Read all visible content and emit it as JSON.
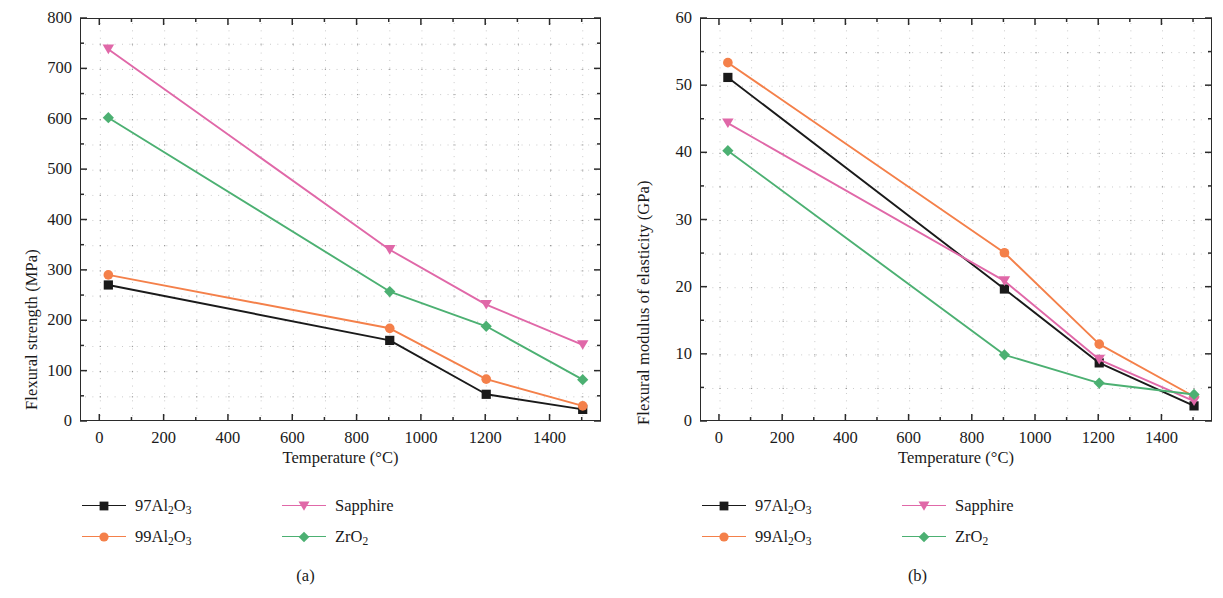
{
  "figure": {
    "panels": [
      {
        "caption": "(a)",
        "chart_data": {
          "type": "line",
          "title": "",
          "xlabel": "Temperature (°C)",
          "ylabel": "Flexural strength (MPa)",
          "xlim": [
            -60,
            1560
          ],
          "ylim": [
            0,
            800
          ],
          "xticks": [
            0,
            200,
            400,
            600,
            800,
            1000,
            1200,
            1400
          ],
          "yticks": [
            0,
            100,
            200,
            300,
            400,
            500,
            600,
            700,
            800
          ],
          "xtick_labels": [
            "0",
            "200",
            "400",
            "600",
            "800",
            "1000",
            "1200",
            "1400"
          ],
          "ytick_labels": [
            "0",
            "100",
            "200",
            "300",
            "400",
            "500",
            "600",
            "700",
            "800"
          ],
          "grid": "dotted-minor",
          "legend_position": "below",
          "x": [
            25,
            900,
            1200,
            1500
          ],
          "series": [
            {
              "name": "97Al2O3",
              "label": "97Al₂O₃",
              "color": "#1a1a1a",
              "marker": "square",
              "values": [
                272,
                162,
                55,
                25
              ]
            },
            {
              "name": "99Al2O3",
              "label": "99Al₂O₃",
              "color": "#f4804a",
              "marker": "circle",
              "values": [
                292,
                186,
                85,
                32
              ]
            },
            {
              "name": "Sapphire",
              "label": "Sapphire",
              "color": "#e068a8",
              "marker": "triangle-down",
              "values": [
                740,
                342,
                233,
                153
              ]
            },
            {
              "name": "ZrO2",
              "label": "ZrO₂",
              "color": "#4cb072",
              "marker": "diamond",
              "values": [
                604,
                259,
                190,
                84
              ]
            }
          ]
        }
      },
      {
        "caption": "(b)",
        "chart_data": {
          "type": "line",
          "title": "",
          "xlabel": "Temperature (°C)",
          "ylabel": "Flexural modulus of elasticity (GPa)",
          "xlim": [
            -60,
            1560
          ],
          "ylim": [
            0,
            60
          ],
          "xticks": [
            0,
            200,
            400,
            600,
            800,
            1000,
            1200,
            1400
          ],
          "yticks": [
            0,
            10,
            20,
            30,
            40,
            50,
            60
          ],
          "xtick_labels": [
            "0",
            "200",
            "400",
            "600",
            "800",
            "1000",
            "1200",
            "1400"
          ],
          "ytick_labels": [
            "0",
            "10",
            "20",
            "30",
            "40",
            "50",
            "60"
          ],
          "grid": "dotted-minor",
          "legend_position": "below",
          "x": [
            25,
            900,
            1200,
            1500
          ],
          "series": [
            {
              "name": "97Al2O3",
              "label": "97Al₂O₃",
              "color": "#1a1a1a",
              "marker": "square",
              "values": [
                51.3,
                19.8,
                8.8,
                2.4
              ]
            },
            {
              "name": "99Al2O3",
              "label": "99Al₂O₃",
              "color": "#f4804a",
              "marker": "circle",
              "values": [
                53.5,
                25.2,
                11.6,
                3.8
              ]
            },
            {
              "name": "Sapphire",
              "label": "Sapphire",
              "color": "#e068a8",
              "marker": "triangle-down",
              "values": [
                44.5,
                21.0,
                9.3,
                3.1
              ]
            },
            {
              "name": "ZrO2",
              "label": "ZrO₂",
              "color": "#4cb072",
              "marker": "diamond",
              "values": [
                40.4,
                10.0,
                5.8,
                4.1
              ]
            }
          ]
        }
      }
    ],
    "legend_order": [
      "97Al2O3",
      "Sapphire",
      "99Al2O3",
      "ZrO2"
    ],
    "colors": {
      "axis": "#2b2b2b",
      "grid": "#8c8c8c",
      "black_series": "#1a1a1a",
      "orange_series": "#f4804a",
      "pink_series": "#e068a8",
      "green_series": "#4cb072",
      "background": "#ffffff"
    }
  }
}
